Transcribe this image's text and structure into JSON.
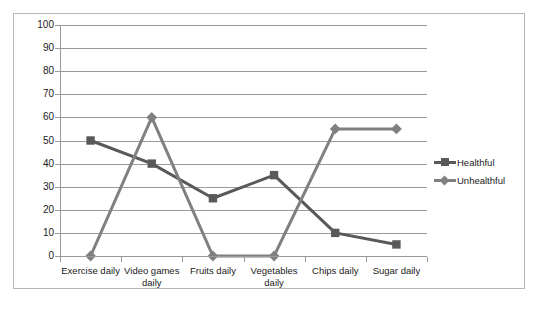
{
  "chart_data": {
    "type": "line",
    "title": "",
    "xlabel": "",
    "ylabel": "",
    "ylim": [
      0,
      100
    ],
    "ytick_step": 10,
    "ytick_labels": [
      "100",
      "90",
      "80",
      "70",
      "60",
      "50",
      "40",
      "30",
      "20",
      "10",
      "0"
    ],
    "grid": true,
    "legend_position": "right",
    "categories": [
      "Exercise daily",
      "Video games daily",
      "Fruits daily",
      "Vegetables daily",
      "Chips daily",
      "Sugar daily"
    ],
    "series": [
      {
        "name": "Healthful",
        "color": "#595959",
        "marker": "square",
        "values": [
          50,
          40,
          25,
          35,
          10,
          5
        ]
      },
      {
        "name": "Unhealthful",
        "color": "#808080",
        "marker": "diamond",
        "values": [
          0,
          60,
          0,
          0,
          55,
          55
        ]
      }
    ]
  },
  "legend": {
    "items": [
      {
        "label": "Healthful"
      },
      {
        "label": "Unhealthful"
      }
    ]
  },
  "colors": {
    "healthful": "#595959",
    "unhealthful": "#808080",
    "gridline": "#9a9a9a",
    "frame": "#b6b6b6",
    "text": "#1a1a1a",
    "background": "#ffffff"
  }
}
